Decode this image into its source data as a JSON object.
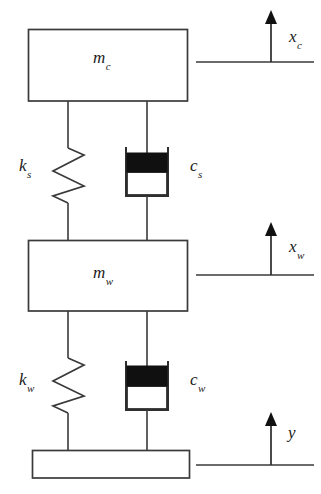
{
  "diagram": {
    "type": "mechanical-schematic",
    "background_color": "#ffffff",
    "line_color": "#3a3a3a",
    "fill_color": "#101010",
    "labels": {
      "sprung_mass": {
        "base": "m",
        "sub": "c",
        "full": "m_c"
      },
      "unsprung_mass": {
        "base": "m",
        "sub": "w",
        "full": "m_w"
      },
      "suspension_spring": {
        "base": "k",
        "sub": "s",
        "full": "k_s"
      },
      "suspension_damper": {
        "base": "c",
        "sub": "s",
        "full": "c_s"
      },
      "tire_spring": {
        "base": "k",
        "sub": "w",
        "full": "k_w"
      },
      "tire_damper": {
        "base": "c",
        "sub": "w",
        "full": "c_w"
      },
      "body_displacement": {
        "base": "x",
        "sub": "c",
        "full": "x_c"
      },
      "wheel_displacement": {
        "base": "x",
        "sub": "w",
        "full": "x_w"
      },
      "road_input": {
        "base": "y",
        "sub": "",
        "full": "y"
      }
    },
    "elements": [
      {
        "name": "car-body-mass-box",
        "kind": "rect",
        "x": 28,
        "y": 29,
        "w": 160,
        "h": 72
      },
      {
        "name": "wheel-mass-box",
        "kind": "rect",
        "x": 28,
        "y": 240,
        "w": 160,
        "h": 71
      },
      {
        "name": "road-base-box",
        "kind": "rect",
        "x": 32,
        "y": 450,
        "w": 158,
        "h": 28
      },
      {
        "name": "suspension-spring",
        "kind": "spring",
        "cx": 68,
        "top": 101,
        "bottom": 240,
        "coils": 3
      },
      {
        "name": "suspension-damper",
        "kind": "damper",
        "cx": 147,
        "top": 101,
        "bottom": 240
      },
      {
        "name": "tire-spring",
        "kind": "spring",
        "cx": 68,
        "top": 311,
        "bottom": 450,
        "coils": 3
      },
      {
        "name": "tire-damper",
        "kind": "damper",
        "cx": 147,
        "top": 311,
        "bottom": 450
      },
      {
        "name": "body-displacement-arrow",
        "kind": "arrow",
        "x": 271,
        "tip_y": 12,
        "base_y": 62,
        "ref_x1": 196,
        "ref_x2": 314
      },
      {
        "name": "wheel-displacement-arrow",
        "kind": "arrow",
        "x": 271,
        "tip_y": 224,
        "base_y": 275,
        "ref_x1": 196,
        "ref_x2": 314
      },
      {
        "name": "road-displacement-arrow",
        "kind": "arrow",
        "x": 271,
        "tip_y": 414,
        "base_y": 465,
        "ref_x1": 196,
        "ref_x2": 314
      }
    ]
  }
}
